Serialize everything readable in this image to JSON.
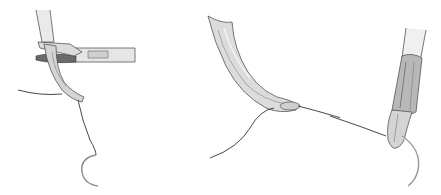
{
  "figure": {
    "background": "#ffffff",
    "panels": [
      {
        "id": "left",
        "subject": "needle-holder-with-curved-clamp-and-suture-needle"
      },
      {
        "id": "middle",
        "subject": "curved-instrument-tip-with-suture-thread"
      },
      {
        "id": "right",
        "subject": "needle-driver-tip-gripping-curved-needle"
      }
    ],
    "colors": {
      "instrument_fill": "#d9d9d9",
      "instrument_light": "#eeeeee",
      "instrument_shadow": "#9a9a9a",
      "outline": "#555555",
      "suture": "#333333",
      "needle": "#bbbbbb"
    }
  }
}
